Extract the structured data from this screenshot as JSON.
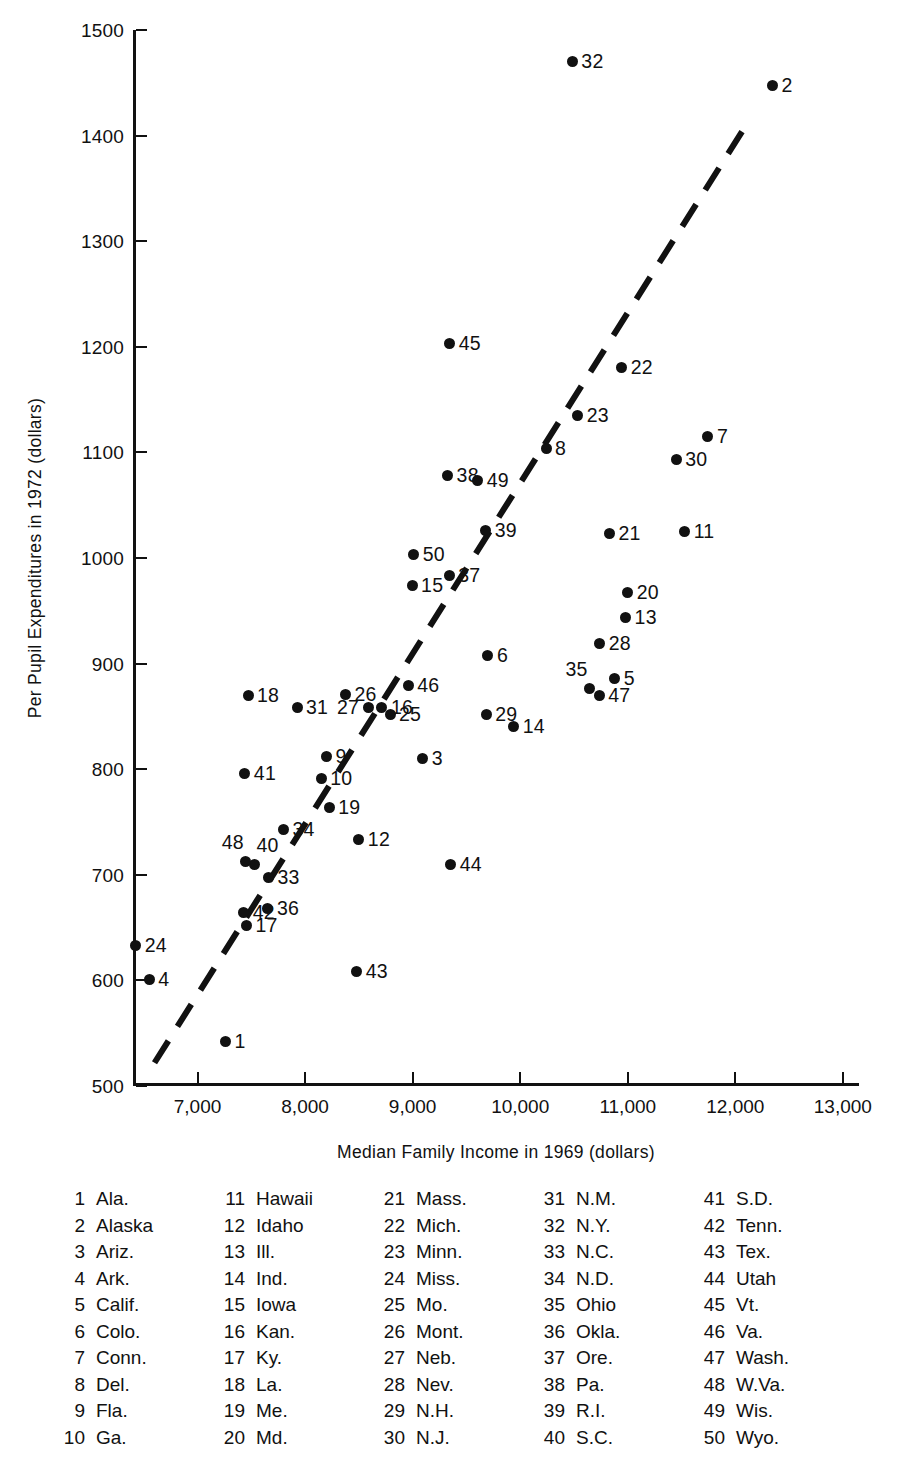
{
  "chart_data": {
    "type": "scatter",
    "title": "",
    "xlabel": "Median Family Income in 1969 (dollars)",
    "ylabel": "Per Pupil Expenditures in 1972 (dollars)",
    "xlim": [
      6400,
      13150
    ],
    "ylim": [
      500,
      1500
    ],
    "xticks": [
      "7,000",
      "8,000",
      "9,000",
      "10,000",
      "11,000",
      "12,000",
      "13,000"
    ],
    "xtick_values": [
      7000,
      8000,
      9000,
      10000,
      11000,
      12000,
      13000
    ],
    "yticks": [
      "500",
      "600",
      "700",
      "800",
      "900",
      "1000",
      "1100",
      "1200",
      "1300",
      "1400",
      "1500"
    ],
    "ytick_values": [
      500,
      600,
      700,
      800,
      900,
      1000,
      1100,
      1200,
      1300,
      1400,
      1500
    ],
    "grid": false,
    "legend_position": "below-plot",
    "trendline": {
      "style": "dashed",
      "x_start": 6600,
      "y_start": 522,
      "x_end": 12070,
      "y_end": 1405
    },
    "points": [
      {
        "id": 1,
        "label": "1",
        "state": "Ala.",
        "x": 7260,
        "y": 542,
        "lp": "lp-right"
      },
      {
        "id": 2,
        "label": "2",
        "state": "Alaska",
        "x": 12345,
        "y": 1447,
        "lp": "lp-right"
      },
      {
        "id": 3,
        "label": "3",
        "state": "Ariz.",
        "x": 9095,
        "y": 810,
        "lp": "lp-right"
      },
      {
        "id": 4,
        "label": "4",
        "state": "Ark.",
        "x": 6550,
        "y": 601,
        "lp": "lp-right"
      },
      {
        "id": 5,
        "label": "5",
        "state": "Calif.",
        "x": 10880,
        "y": 886,
        "lp": "lp-right"
      },
      {
        "id": 6,
        "label": "6",
        "state": "Colo.",
        "x": 9700,
        "y": 908,
        "lp": "lp-right"
      },
      {
        "id": 7,
        "label": "7",
        "state": "Conn.",
        "x": 11745,
        "y": 1115,
        "lp": "lp-right"
      },
      {
        "id": 8,
        "label": "8",
        "state": "Del.",
        "x": 10240,
        "y": 1104,
        "lp": "lp-right"
      },
      {
        "id": 9,
        "label": "9",
        "state": "Fla.",
        "x": 8200,
        "y": 812,
        "lp": "lp-right"
      },
      {
        "id": 10,
        "label": "10",
        "state": "Ga.",
        "x": 8150,
        "y": 791,
        "lp": "lp-right"
      },
      {
        "id": 11,
        "label": "11",
        "state": "Hawaii",
        "x": 11530,
        "y": 1025,
        "lp": "lp-right"
      },
      {
        "id": 12,
        "label": "12",
        "state": "Idaho",
        "x": 8500,
        "y": 733,
        "lp": "lp-right"
      },
      {
        "id": 13,
        "label": "13",
        "state": "Ill.",
        "x": 10980,
        "y": 944,
        "lp": "lp-right"
      },
      {
        "id": 14,
        "label": "14",
        "state": "Ind.",
        "x": 9940,
        "y": 840,
        "lp": "lp-right"
      },
      {
        "id": 15,
        "label": "15",
        "state": "Iowa",
        "x": 8995,
        "y": 974,
        "lp": "lp-right"
      },
      {
        "id": 16,
        "label": "16",
        "state": "Kan.",
        "x": 8715,
        "y": 858,
        "lp": "lp-right"
      },
      {
        "id": 17,
        "label": "17",
        "state": "Ky.",
        "x": 7455,
        "y": 652,
        "lp": "lp-right"
      },
      {
        "id": 18,
        "label": "18",
        "state": "La.",
        "x": 7470,
        "y": 870,
        "lp": "lp-right"
      },
      {
        "id": 19,
        "label": "19",
        "state": "Me.",
        "x": 8225,
        "y": 764,
        "lp": "lp-right"
      },
      {
        "id": 20,
        "label": "20",
        "state": "Md.",
        "x": 11000,
        "y": 967,
        "lp": "lp-right"
      },
      {
        "id": 21,
        "label": "21",
        "state": "Mass.",
        "x": 10830,
        "y": 1023,
        "lp": "lp-right"
      },
      {
        "id": 22,
        "label": "22",
        "state": "Mich.",
        "x": 10945,
        "y": 1180,
        "lp": "lp-right"
      },
      {
        "id": 23,
        "label": "23",
        "state": "Minn.",
        "x": 10535,
        "y": 1135,
        "lp": "lp-right"
      },
      {
        "id": 24,
        "label": "24",
        "state": "Miss.",
        "x": 6425,
        "y": 633,
        "lp": "lp-right"
      },
      {
        "id": 25,
        "label": "25",
        "state": "Mo.",
        "x": 8790,
        "y": 852,
        "lp": "lp-right"
      },
      {
        "id": 26,
        "label": "26",
        "state": "Mont.",
        "x": 8375,
        "y": 871,
        "lp": "lp-right"
      },
      {
        "id": 27,
        "label": "27",
        "state": "Neb.",
        "x": 8585,
        "y": 858,
        "lp": "lp-left"
      },
      {
        "id": 28,
        "label": "28",
        "state": "Nev.",
        "x": 10740,
        "y": 919,
        "lp": "lp-right"
      },
      {
        "id": 29,
        "label": "29",
        "state": "N.H.",
        "x": 9685,
        "y": 852,
        "lp": "lp-right"
      },
      {
        "id": 30,
        "label": "30",
        "state": "N.J.",
        "x": 11450,
        "y": 1093,
        "lp": "lp-right"
      },
      {
        "id": 31,
        "label": "31",
        "state": "N.M.",
        "x": 7925,
        "y": 858,
        "lp": "lp-right"
      },
      {
        "id": 32,
        "label": "32",
        "state": "N.Y.",
        "x": 10485,
        "y": 1470,
        "lp": "lp-right"
      },
      {
        "id": 33,
        "label": "33",
        "state": "N.C.",
        "x": 7660,
        "y": 697,
        "lp": "lp-right"
      },
      {
        "id": 34,
        "label": "34",
        "state": "N.D.",
        "x": 7800,
        "y": 743,
        "lp": "lp-right"
      },
      {
        "id": 35,
        "label": "35",
        "state": "Ohio",
        "x": 10645,
        "y": 876,
        "lp": "lp-upleft"
      },
      {
        "id": 36,
        "label": "36",
        "state": "Okla.",
        "x": 7655,
        "y": 668,
        "lp": "lp-right"
      },
      {
        "id": 37,
        "label": "37",
        "state": "Ore.",
        "x": 9340,
        "y": 983,
        "lp": "lp-right"
      },
      {
        "id": 38,
        "label": "38",
        "state": "Pa.",
        "x": 9325,
        "y": 1078,
        "lp": "lp-right"
      },
      {
        "id": 39,
        "label": "39",
        "state": "R.I.",
        "x": 9680,
        "y": 1026,
        "lp": "lp-right"
      },
      {
        "id": 40,
        "label": "40",
        "state": "S.C.",
        "x": 7530,
        "y": 710,
        "lp": "lp-upright"
      },
      {
        "id": 41,
        "label": "41",
        "state": "S.D.",
        "x": 7440,
        "y": 796,
        "lp": "lp-right"
      },
      {
        "id": 42,
        "label": "42",
        "state": "Tenn.",
        "x": 7430,
        "y": 664,
        "lp": "lp-right"
      },
      {
        "id": 43,
        "label": "43",
        "state": "Tex.",
        "x": 8480,
        "y": 608,
        "lp": "lp-right"
      },
      {
        "id": 44,
        "label": "44",
        "state": "Utah",
        "x": 9355,
        "y": 710,
        "lp": "lp-right"
      },
      {
        "id": 45,
        "label": "45",
        "state": "Vt.",
        "x": 9345,
        "y": 1203,
        "lp": "lp-right"
      },
      {
        "id": 46,
        "label": "46",
        "state": "Va.",
        "x": 8960,
        "y": 879,
        "lp": "lp-right"
      },
      {
        "id": 47,
        "label": "47",
        "state": "Wash.",
        "x": 10735,
        "y": 870,
        "lp": "lp-right"
      },
      {
        "id": 48,
        "label": "48",
        "state": "W.Va.",
        "x": 7450,
        "y": 713,
        "lp": "lp-upleft"
      },
      {
        "id": 49,
        "label": "49",
        "state": "Wis.",
        "x": 9605,
        "y": 1073,
        "lp": "lp-right"
      },
      {
        "id": 50,
        "label": "50",
        "state": "Wyo.",
        "x": 9010,
        "y": 1003,
        "lp": "lp-right"
      }
    ]
  },
  "legend": {
    "columns": [
      [
        {
          "num": "1",
          "name": "Ala."
        },
        {
          "num": "2",
          "name": "Alaska"
        },
        {
          "num": "3",
          "name": "Ariz."
        },
        {
          "num": "4",
          "name": "Ark."
        },
        {
          "num": "5",
          "name": "Calif."
        },
        {
          "num": "6",
          "name": "Colo."
        },
        {
          "num": "7",
          "name": "Conn."
        },
        {
          "num": "8",
          "name": "Del."
        },
        {
          "num": "9",
          "name": "Fla."
        },
        {
          "num": "10",
          "name": "Ga."
        }
      ],
      [
        {
          "num": "11",
          "name": "Hawaii"
        },
        {
          "num": "12",
          "name": "Idaho"
        },
        {
          "num": "13",
          "name": "Ill."
        },
        {
          "num": "14",
          "name": "Ind."
        },
        {
          "num": "15",
          "name": "Iowa"
        },
        {
          "num": "16",
          "name": "Kan."
        },
        {
          "num": "17",
          "name": "Ky."
        },
        {
          "num": "18",
          "name": "La."
        },
        {
          "num": "19",
          "name": "Me."
        },
        {
          "num": "20",
          "name": "Md."
        }
      ],
      [
        {
          "num": "21",
          "name": "Mass."
        },
        {
          "num": "22",
          "name": "Mich."
        },
        {
          "num": "23",
          "name": "Minn."
        },
        {
          "num": "24",
          "name": "Miss."
        },
        {
          "num": "25",
          "name": "Mo."
        },
        {
          "num": "26",
          "name": "Mont."
        },
        {
          "num": "27",
          "name": "Neb."
        },
        {
          "num": "28",
          "name": "Nev."
        },
        {
          "num": "29",
          "name": "N.H."
        },
        {
          "num": "30",
          "name": "N.J."
        }
      ],
      [
        {
          "num": "31",
          "name": "N.M."
        },
        {
          "num": "32",
          "name": "N.Y."
        },
        {
          "num": "33",
          "name": "N.C."
        },
        {
          "num": "34",
          "name": "N.D."
        },
        {
          "num": "35",
          "name": "Ohio"
        },
        {
          "num": "36",
          "name": "Okla."
        },
        {
          "num": "37",
          "name": "Ore."
        },
        {
          "num": "38",
          "name": "Pa."
        },
        {
          "num": "39",
          "name": "R.I."
        },
        {
          "num": "40",
          "name": "S.C."
        }
      ],
      [
        {
          "num": "41",
          "name": "S.D."
        },
        {
          "num": "42",
          "name": "Tenn."
        },
        {
          "num": "43",
          "name": "Tex."
        },
        {
          "num": "44",
          "name": "Utah"
        },
        {
          "num": "45",
          "name": "Vt."
        },
        {
          "num": "46",
          "name": "Va."
        },
        {
          "num": "47",
          "name": "Wash."
        },
        {
          "num": "48",
          "name": "W.Va."
        },
        {
          "num": "49",
          "name": "Wis."
        },
        {
          "num": "50",
          "name": "Wyo."
        }
      ]
    ]
  },
  "colors": {
    "ink": "#111111",
    "background": "#ffffff"
  }
}
